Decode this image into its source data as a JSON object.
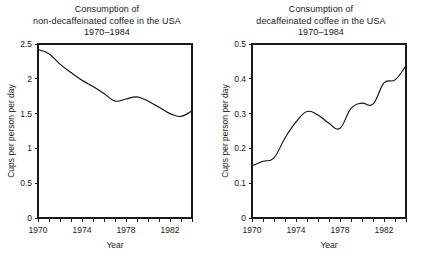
{
  "figure": {
    "width": 428,
    "height": 260,
    "background": "#ffffff",
    "line_color": "#111111",
    "axis_color": "#1a1a1a"
  },
  "panels": [
    {
      "id": "left",
      "title_lines": [
        "Consumption of",
        "non-decaffeinated coffee in the USA",
        "1970–1984"
      ],
      "xlabel": "Year",
      "ylabel": "Cups per person per day",
      "ytick_labels": [
        "0",
        "0.5",
        "1",
        "1.5",
        "2",
        "2.5"
      ],
      "ytick_values": [
        0,
        0.5,
        1,
        1.5,
        2,
        2.5
      ],
      "xtick_labels": [
        "1970",
        "1974",
        "1978",
        "1982"
      ],
      "xtick_values": [
        1970,
        1974,
        1978,
        1982
      ],
      "xminor_values": [
        1970,
        1971,
        1972,
        1973,
        1974,
        1975,
        1976,
        1977,
        1978,
        1979,
        1980,
        1981,
        1982,
        1983,
        1984
      ]
    },
    {
      "id": "right",
      "title_lines": [
        "Consumption of",
        "decaffeinated coffee in the USA",
        "1970–1984"
      ],
      "xlabel": "Year",
      "ylabel": "Cups per person per day",
      "ytick_labels": [
        "0",
        "0.1",
        "0.2",
        "0.3",
        "0.4",
        "0.5"
      ],
      "ytick_values": [
        0,
        0.1,
        0.2,
        0.3,
        0.4,
        0.5
      ],
      "xtick_labels": [
        "1970",
        "1974",
        "1978",
        "1982"
      ],
      "xtick_values": [
        1970,
        1974,
        1978,
        1982
      ],
      "xminor_values": [
        1970,
        1971,
        1972,
        1973,
        1974,
        1975,
        1976,
        1977,
        1978,
        1979,
        1980,
        1981,
        1982,
        1983,
        1984
      ]
    }
  ],
  "chart_data": [
    {
      "type": "line",
      "title": "Consumption of non-decaffeinated coffee in the USA 1970-1984",
      "xlabel": "Year",
      "ylabel": "Cups per person per day",
      "xlim": [
        1970,
        1984
      ],
      "ylim": [
        0,
        2.5
      ],
      "grid": false,
      "legend": null,
      "x": [
        1970,
        1971,
        1972,
        1973,
        1974,
        1975,
        1976,
        1977,
        1978,
        1979,
        1980,
        1981,
        1982,
        1983,
        1984
      ],
      "values": [
        2.42,
        2.36,
        2.21,
        2.09,
        1.98,
        1.89,
        1.79,
        1.68,
        1.71,
        1.74,
        1.68,
        1.59,
        1.5,
        1.46,
        1.54
      ],
      "series": [
        {
          "name": "non-decaffeinated coffee",
          "values": [
            2.42,
            2.36,
            2.21,
            2.09,
            1.98,
            1.89,
            1.79,
            1.68,
            1.71,
            1.74,
            1.68,
            1.59,
            1.5,
            1.46,
            1.54
          ]
        }
      ]
    },
    {
      "type": "line",
      "title": "Consumption of decaffeinated coffee in the USA 1970-1984",
      "xlabel": "Year",
      "ylabel": "Cups per person per day",
      "xlim": [
        1970,
        1984
      ],
      "ylim": [
        0,
        0.5
      ],
      "grid": false,
      "legend": null,
      "x": [
        1970,
        1971,
        1972,
        1973,
        1974,
        1975,
        1976,
        1977,
        1978,
        1979,
        1980,
        1981,
        1982,
        1983,
        1984
      ],
      "values": [
        0.15,
        0.163,
        0.173,
        0.23,
        0.276,
        0.306,
        0.296,
        0.272,
        0.258,
        0.315,
        0.33,
        0.327,
        0.388,
        0.397,
        0.437
      ],
      "series": [
        {
          "name": "decaffeinated coffee",
          "values": [
            0.15,
            0.163,
            0.173,
            0.23,
            0.276,
            0.306,
            0.296,
            0.272,
            0.258,
            0.315,
            0.33,
            0.327,
            0.388,
            0.397,
            0.437
          ]
        }
      ]
    }
  ]
}
